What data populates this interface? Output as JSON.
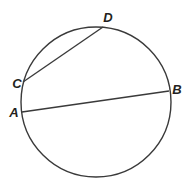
{
  "diagram": {
    "type": "circle-with-chords",
    "stroke_color": "#3a3a3a",
    "label_color": "#231f20",
    "circle": {
      "cx": 96,
      "cy": 102,
      "r": 75
    },
    "points": {
      "A": {
        "label": "A",
        "x": 22,
        "y": 112,
        "lx": 14,
        "ly": 117
      },
      "B": {
        "label": "B",
        "x": 169,
        "y": 91,
        "lx": 177,
        "ly": 94
      },
      "C": {
        "label": "C",
        "x": 23,
        "y": 82,
        "lx": 17,
        "ly": 88
      },
      "D": {
        "label": "D",
        "x": 103,
        "y": 27,
        "lx": 108,
        "ly": 22
      }
    },
    "chords": [
      {
        "from": "A",
        "to": "B"
      },
      {
        "from": "C",
        "to": "D"
      }
    ]
  }
}
